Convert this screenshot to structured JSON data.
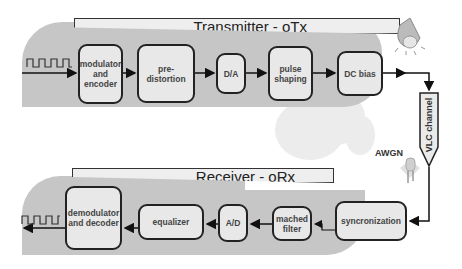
{
  "transmitter": {
    "title": "Transmitter - oTx",
    "blocks": [
      {
        "label": "modulator and encoder"
      },
      {
        "label": "pre-distortion"
      },
      {
        "label": "D/A"
      },
      {
        "label": "pulse shaping"
      },
      {
        "label": "DC bias"
      }
    ]
  },
  "channel": {
    "label": "VLC channel",
    "noise_label": "AWGN"
  },
  "receiver": {
    "title": "Receiver - oRx",
    "blocks": [
      {
        "label": "syncronization"
      },
      {
        "label": "mached filter"
      },
      {
        "label": "A/D"
      },
      {
        "label": "equalizer"
      },
      {
        "label": "demodulator and decoder"
      }
    ]
  },
  "icons": {
    "transmitter_source": "light-bulb-icon",
    "receiver_sensor": "photodiode-led-icon",
    "input_signal": "square-wave-icon",
    "output_signal": "square-wave-icon"
  },
  "colors": {
    "panel": "#c6c6c6",
    "block_fill": "#e8e8e8",
    "title_fill": "#eeeeee",
    "stroke": "#222222"
  }
}
